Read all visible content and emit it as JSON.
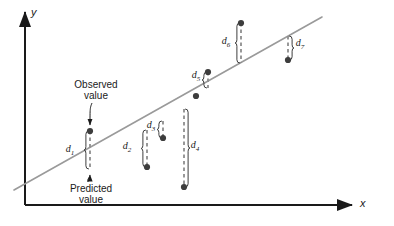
{
  "figure": {
    "type": "scatter-with-regression-line",
    "background": "#ffffff",
    "axes": {
      "x_label": "x",
      "y_label": "y",
      "axis_color": "#1a1a1a",
      "x_axis": {
        "x1": 25,
        "y1": 205,
        "x2": 352,
        "y2": 205
      },
      "y_axis": {
        "x1": 25,
        "y1": 205,
        "x2": 25,
        "y2": 12
      }
    },
    "regression_line": {
      "color": "#9a9a9a",
      "x1": 14,
      "y1": 190,
      "x2": 322,
      "y2": 17
    },
    "annotations": [
      {
        "name": "observed-value",
        "line1": "Observed",
        "line2": "value",
        "x": 96,
        "y": 88
      },
      {
        "name": "predicted-value",
        "line1": "Predicted",
        "line2": "value",
        "x": 91,
        "y": 192
      }
    ],
    "point_color": "#3d3d3d",
    "dash_color": "#8e8e8e",
    "brace_color": "#3d3d3d",
    "label_color": "#1a1a1a"
  },
  "chart_data": {
    "type": "scatter",
    "title": "",
    "xlabel": "x",
    "ylabel": "y",
    "grid": false,
    "legend": null,
    "note": "Residuals d1..d7 between observed values (dots) and predicted values on the regression line",
    "residuals": [
      {
        "label": "d",
        "sub": "1",
        "x": 90,
        "observed_y": 131,
        "predicted_y": 169,
        "observed_below_line": false,
        "brace_side": "left",
        "label_x": 70,
        "label_y": 152
      },
      {
        "label": "d",
        "sub": "2",
        "x": 147,
        "observed_y": 167,
        "predicted_y": 130,
        "observed_below_line": true,
        "brace_side": "left",
        "label_x": 127,
        "label_y": 149
      },
      {
        "label": "d",
        "sub": "3",
        "x": 163,
        "observed_y": 138,
        "predicted_y": 121,
        "observed_below_line": true,
        "brace_side": "left",
        "label_x": 151,
        "label_y": 128
      },
      {
        "label": "d",
        "sub": "4",
        "x": 184,
        "observed_y": 187,
        "predicted_y": 109,
        "observed_below_line": true,
        "brace_side": "right",
        "label_x": 195,
        "label_y": 148
      },
      {
        "label": "d",
        "sub": "5",
        "x": 208,
        "observed_y": 72,
        "predicted_y": 88,
        "observed_below_line": false,
        "brace_side": "left",
        "label_x": 196,
        "label_y": 78
      },
      {
        "label": "d",
        "sub": "6",
        "x": 241,
        "observed_y": 23,
        "predicted_y": 63,
        "observed_below_line": false,
        "brace_side": "left",
        "label_x": 226,
        "label_y": 44
      },
      {
        "label": "d",
        "sub": "7",
        "x": 288,
        "observed_y": 60,
        "predicted_y": 36,
        "observed_below_line": true,
        "brace_side": "right",
        "label_x": 300,
        "label_y": 46
      }
    ],
    "on_line_points": [
      {
        "x": 196,
        "y": 96
      }
    ]
  }
}
